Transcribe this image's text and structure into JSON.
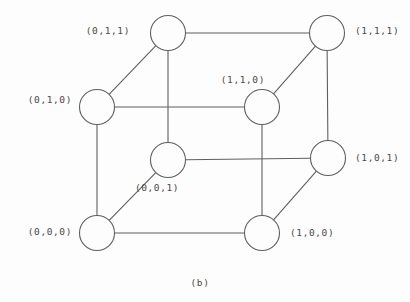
{
  "figure": {
    "caption": "(b)",
    "caption_x": 200,
    "caption_y": 282,
    "background_color": "#fdfdfd",
    "stroke_color": "#5f5f5f",
    "text_color": "#4a4a4a",
    "node_radius": 17.5
  },
  "chart_data": {
    "type": "diagram",
    "title": "(b)",
    "subtitle": "",
    "xlabel": "",
    "ylabel": "",
    "graph_kind": "hypercube-graph-Q3",
    "node_count": 8,
    "edge_count": 12,
    "nodes": [
      {
        "id": "011",
        "label": "(0,1,1)",
        "x": 168,
        "y": 33,
        "label_x": 130,
        "label_y": 31,
        "label_anchor": "right"
      },
      {
        "id": "111",
        "label": "(1,1,1)",
        "x": 327,
        "y": 33,
        "label_x": 355,
        "label_y": 31,
        "label_anchor": "left"
      },
      {
        "id": "010",
        "label": "(0,1,0)",
        "x": 97,
        "y": 107,
        "label_x": 72,
        "label_y": 100,
        "label_anchor": "right"
      },
      {
        "id": "110",
        "label": "(1,1,0)",
        "x": 262,
        "y": 107,
        "label_x": 265,
        "label_y": 80,
        "label_anchor": "right"
      },
      {
        "id": "001",
        "label": "(0,0,1)",
        "x": 168,
        "y": 160,
        "label_x": 157,
        "label_y": 188,
        "label_anchor": "center"
      },
      {
        "id": "101",
        "label": "(1,0,1)",
        "x": 328,
        "y": 158,
        "label_x": 355,
        "label_y": 158,
        "label_anchor": "left"
      },
      {
        "id": "000",
        "label": "(0,0,0)",
        "x": 97,
        "y": 233,
        "label_x": 72,
        "label_y": 232,
        "label_anchor": "right"
      },
      {
        "id": "100",
        "label": "(1,0,0)",
        "x": 262,
        "y": 233,
        "label_x": 290,
        "label_y": 233,
        "label_anchor": "left"
      }
    ],
    "edges": [
      {
        "from": "011",
        "to": "111"
      },
      {
        "from": "011",
        "to": "010"
      },
      {
        "from": "011",
        "to": "001"
      },
      {
        "from": "111",
        "to": "110"
      },
      {
        "from": "111",
        "to": "101"
      },
      {
        "from": "010",
        "to": "110"
      },
      {
        "from": "010",
        "to": "000"
      },
      {
        "from": "110",
        "to": "100"
      },
      {
        "from": "001",
        "to": "101"
      },
      {
        "from": "001",
        "to": "000"
      },
      {
        "from": "101",
        "to": "100"
      },
      {
        "from": "000",
        "to": "100"
      }
    ]
  }
}
